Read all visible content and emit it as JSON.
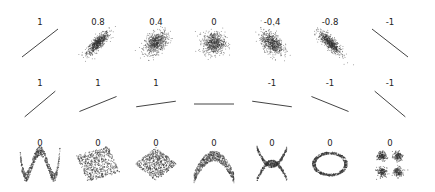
{
  "chart_data": {
    "type": "scatter",
    "title": "",
    "xlabel": "",
    "ylabel": "",
    "grid": false,
    "legend": null,
    "rows": [
      {
        "row": 1,
        "panels": [
          {
            "label": "1",
            "kind": "gaussian",
            "r": 1.0
          },
          {
            "label": "0.8",
            "kind": "gaussian",
            "r": 0.8
          },
          {
            "label": "0.4",
            "kind": "gaussian",
            "r": 0.4
          },
          {
            "label": "0",
            "kind": "gaussian",
            "r": 0.0
          },
          {
            "label": "-0.4",
            "kind": "gaussian",
            "r": -0.4
          },
          {
            "label": "-0.8",
            "kind": "gaussian",
            "r": -0.8
          },
          {
            "label": "-1",
            "kind": "gaussian",
            "r": -1.0
          }
        ]
      },
      {
        "row": 2,
        "panels": [
          {
            "label": "1",
            "kind": "line",
            "slope_deg": 40
          },
          {
            "label": "1",
            "kind": "line",
            "slope_deg": 22
          },
          {
            "label": "1",
            "kind": "line",
            "slope_deg": 8
          },
          {
            "label": "",
            "kind": "line",
            "slope_deg": 0
          },
          {
            "label": "-1",
            "kind": "line",
            "slope_deg": -8
          },
          {
            "label": "-1",
            "kind": "line",
            "slope_deg": -22
          },
          {
            "label": "-1",
            "kind": "line",
            "slope_deg": -40
          }
        ]
      },
      {
        "row": 3,
        "panels": [
          {
            "label": "0",
            "kind": "w-shape"
          },
          {
            "label": "0",
            "kind": "rotated-square"
          },
          {
            "label": "0",
            "kind": "diamond"
          },
          {
            "label": "0",
            "kind": "parabola"
          },
          {
            "label": "0",
            "kind": "x-shape"
          },
          {
            "label": "0",
            "kind": "ring"
          },
          {
            "label": "0",
            "kind": "four-clusters"
          }
        ]
      }
    ]
  },
  "colors": {
    "points": "#333333",
    "label": "#222222",
    "background": "#ffffff"
  }
}
